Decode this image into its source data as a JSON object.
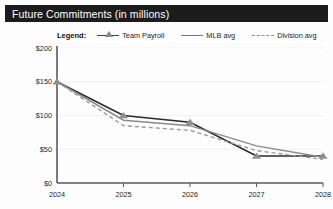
{
  "header": {
    "title": "Future Commitments (in millions)"
  },
  "legend": {
    "label": "Legend:",
    "items": [
      {
        "name": "Team Payroll",
        "style": "line-with-triangle-marker",
        "color": "#2b2b2b"
      },
      {
        "name": "MLB avg",
        "style": "solid-line",
        "color": "#8a8a8a"
      },
      {
        "name": "Division avg",
        "style": "dashed-line",
        "color": "#9a9a9a"
      }
    ]
  },
  "chart_data": {
    "type": "line",
    "title": "Future Commitments (in millions)",
    "xlabel": "",
    "ylabel": "",
    "x": [
      "2024",
      "2025",
      "2026",
      "2027",
      "2028"
    ],
    "categories": [
      "2024",
      "2025",
      "2026",
      "2027",
      "2028"
    ],
    "series": [
      {
        "name": "Team Payroll",
        "values": [
          150,
          100,
          90,
          40,
          40
        ],
        "marker": "triangle",
        "line": "solid",
        "color": "#2b2b2b"
      },
      {
        "name": "MLB avg",
        "values": [
          150,
          93,
          85,
          55,
          38
        ],
        "marker": "none",
        "line": "solid",
        "color": "#8a8a8a"
      },
      {
        "name": "Division avg",
        "values": [
          150,
          85,
          78,
          48,
          35
        ],
        "marker": "none",
        "line": "dashed",
        "color": "#9a9a9a"
      }
    ],
    "yticks": [
      "$0",
      "$50",
      "$100",
      "$150",
      "$200"
    ],
    "ytick_values": [
      0,
      50,
      100,
      150,
      200
    ],
    "xticks": [
      "2024",
      "2025",
      "2026",
      "2027",
      "2028"
    ],
    "ylim": [
      0,
      200
    ],
    "grid": true,
    "legend_position": "top"
  }
}
